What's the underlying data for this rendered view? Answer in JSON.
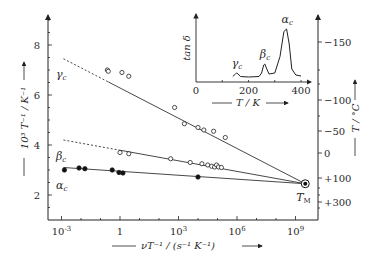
{
  "chart_data": [
    {
      "type": "scatter",
      "title": "",
      "xlabel": "νT⁻¹ / (s⁻¹ K⁻¹)",
      "xscale": "log",
      "xlim": [
        -3.8,
        9.8
      ],
      "x_ticks": [
        {
          "exp": -3,
          "label": "10⁻³"
        },
        {
          "exp": 0,
          "label": "1"
        },
        {
          "exp": 3,
          "label": "10³"
        },
        {
          "exp": 6,
          "label": "10⁶"
        },
        {
          "exp": 9,
          "label": "10⁹"
        }
      ],
      "ylabel": "10³ T⁻¹ / K⁻¹",
      "ylim": [
        1.0,
        9.2
      ],
      "y_ticks": [
        2,
        4,
        6,
        8
      ],
      "y2label": "T / °C",
      "y2_ticks": [
        "−150",
        "−100",
        "−50",
        "0",
        "+100",
        "+300"
      ],
      "grid": false,
      "annotation": {
        "label": "T",
        "sub": "M",
        "log10_x": 9.5,
        "y": 2.45
      },
      "series": [
        {
          "name": "γc",
          "label_greek": "γ",
          "marker": "open-circle",
          "line_from": [
            -2.9,
            7.45
          ],
          "dashed_until_log10_x": -0.6,
          "line_to": [
            9.5,
            2.45
          ],
          "points": [
            [
              -0.65,
              7.0
            ],
            [
              -0.6,
              6.95
            ],
            [
              0.1,
              6.9
            ],
            [
              0.45,
              6.75
            ],
            [
              2.8,
              5.5
            ],
            [
              3.3,
              4.85
            ],
            [
              4.0,
              4.7
            ],
            [
              4.3,
              4.6
            ],
            [
              4.8,
              4.55
            ],
            [
              5.4,
              4.3
            ]
          ]
        },
        {
          "name": "βc",
          "label_greek": "β",
          "marker": "open-circle",
          "line_from": [
            -2.9,
            4.2
          ],
          "dashed_until_log10_x": 0.0,
          "line_to": [
            9.5,
            2.45
          ],
          "points": [
            [
              0.0,
              3.7
            ],
            [
              0.45,
              3.65
            ],
            [
              2.6,
              3.45
            ],
            [
              3.6,
              3.3
            ],
            [
              4.2,
              3.25
            ],
            [
              4.5,
              3.2
            ],
            [
              4.7,
              3.15
            ],
            [
              4.85,
              3.12
            ],
            [
              4.95,
              3.2
            ],
            [
              5.05,
              3.12
            ],
            [
              5.2,
              3.1
            ]
          ]
        },
        {
          "name": "αc",
          "label_greek": "α",
          "marker": "filled-circle",
          "line_from": [
            -2.9,
            3.1
          ],
          "dashed_until_log10_x": null,
          "line_to": [
            9.5,
            2.45
          ],
          "points": [
            [
              -2.85,
              3.0
            ],
            [
              -2.1,
              3.08
            ],
            [
              -1.8,
              3.05
            ],
            [
              -0.4,
              3.0
            ],
            [
              -0.05,
              2.9
            ],
            [
              0.15,
              2.88
            ],
            [
              4.0,
              2.72
            ]
          ]
        }
      ]
    },
    {
      "type": "line",
      "title": "",
      "xlabel": "T / K",
      "ylabel": "tan δ",
      "xlim": [
        0,
        420
      ],
      "x_ticks": [
        0,
        200,
        400
      ],
      "grid": false,
      "peaks": [
        {
          "name": "γc",
          "label_greek": "γ",
          "T": 155
        },
        {
          "name": "βc",
          "label_greek": "β",
          "T": 262
        },
        {
          "name": "αc",
          "label_greek": "α",
          "T": 345
        }
      ],
      "x": [
        140,
        150,
        155,
        160,
        170,
        200,
        240,
        250,
        258,
        262,
        268,
        278,
        300,
        320,
        335,
        345,
        355,
        365,
        380,
        400
      ],
      "values": [
        0.05,
        0.1,
        0.12,
        0.1,
        0.05,
        0.04,
        0.05,
        0.12,
        0.28,
        0.3,
        0.22,
        0.1,
        0.12,
        0.45,
        0.95,
        1.0,
        0.7,
        0.2,
        0.08,
        0.06
      ]
    }
  ]
}
